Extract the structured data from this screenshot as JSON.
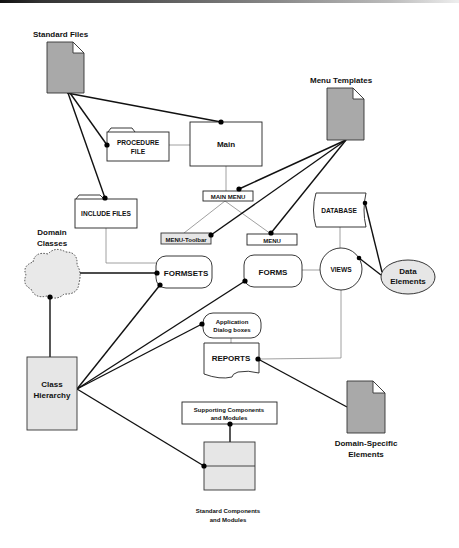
{
  "diagram": {
    "nodes": {
      "standard_files": {
        "label": "Standard Files",
        "shape": "document-icon"
      },
      "procedure_file": {
        "line1": "PROCEDURE",
        "line2": "FILE",
        "shape": "folder"
      },
      "main": {
        "label": "Main",
        "shape": "rectangle"
      },
      "include_files": {
        "label": "INCLUDE FILES",
        "shape": "folder"
      },
      "menu_templates": {
        "label": "Menu Templates",
        "shape": "document-icon"
      },
      "main_menu": {
        "label": "MAIN MENU",
        "shape": "rectangle"
      },
      "menu_toolbar": {
        "label": "MENU-Toolbar",
        "shape": "rectangle"
      },
      "menu": {
        "label": "MENU",
        "shape": "rectangle"
      },
      "database": {
        "label": "DATABASE",
        "shape": "stored-data"
      },
      "domain_classes": {
        "line1": "Domain",
        "line2": "Classes",
        "shape": "cloud"
      },
      "formsets": {
        "label": "FORMSETS",
        "shape": "rounded-rectangle"
      },
      "forms": {
        "label": "FORMS",
        "shape": "rounded-rectangle"
      },
      "views": {
        "label": "VIEWS",
        "shape": "circle"
      },
      "data_elements": {
        "line1": "Data",
        "line2": "Elements",
        "shape": "ellipse"
      },
      "application_dialog_boxes": {
        "line1": "Application",
        "line2": "Dialog boxes",
        "shape": "rounded-rectangle"
      },
      "reports": {
        "label": "REPORTS",
        "shape": "document"
      },
      "domain_specific_elements": {
        "line1": "Domain-Specific",
        "line2": "Elements",
        "shape": "document-icon"
      },
      "class_hierarchy": {
        "line1": "Class",
        "line2": "Hierarchy",
        "shape": "rectangle"
      },
      "supporting_components": {
        "line1": "Supporting Components",
        "line2": "and Modules",
        "shape": "rectangle"
      },
      "standard_components": {
        "line1": "Standard Components",
        "line2": "and Modules",
        "shape": "split-rectangle"
      }
    },
    "edges_strong": [
      [
        "standard_files",
        "main"
      ],
      [
        "standard_files",
        "procedure_file"
      ],
      [
        "standard_files",
        "include_files"
      ],
      [
        "menu_templates",
        "main_menu"
      ],
      [
        "menu_templates",
        "menu_toolbar"
      ],
      [
        "menu_templates",
        "menu"
      ],
      [
        "domain_classes",
        "formsets"
      ],
      [
        "domain_classes",
        "class_hierarchy"
      ],
      [
        "class_hierarchy",
        "formsets"
      ],
      [
        "class_hierarchy",
        "forms"
      ],
      [
        "class_hierarchy",
        "application_dialog_boxes"
      ],
      [
        "class_hierarchy",
        "standard_components"
      ],
      [
        "views",
        "data_elements"
      ],
      [
        "database",
        "data_elements"
      ],
      [
        "reports",
        "domain_specific_elements"
      ],
      [
        "supporting_components",
        "standard_components"
      ]
    ],
    "edges_weak": [
      [
        "procedure_file",
        "main"
      ],
      [
        "main",
        "main_menu"
      ],
      [
        "main_menu",
        "menu_toolbar"
      ],
      [
        "main_menu",
        "menu"
      ],
      [
        "include_files",
        "formsets"
      ],
      [
        "forms",
        "views"
      ],
      [
        "database",
        "views"
      ],
      [
        "views",
        "reports"
      ],
      [
        "application_dialog_boxes",
        "reports"
      ]
    ],
    "colors": {
      "document_fill": "#a9a9a9",
      "shaded_fill": "#e6e6e6",
      "line": "#111111",
      "weak_line": "#888888"
    }
  }
}
